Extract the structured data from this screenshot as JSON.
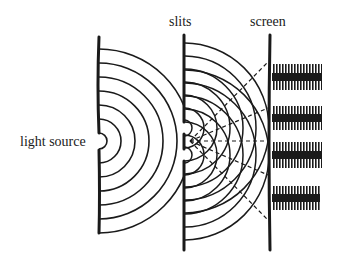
{
  "diagram": {
    "labels": {
      "source": "light source",
      "slits": "slits",
      "screen": "screen"
    },
    "colors": {
      "ink": "#1a1a1a",
      "background": "#ffffff"
    },
    "geometry": {
      "single_slit_barrier_x": 99,
      "single_slit_y": 141,
      "double_slit_barrier_x": 184,
      "double_slit_ys": [
        128,
        155
      ],
      "screen_x": 270,
      "source_wave_radii": [
        8,
        22,
        36,
        50,
        64,
        78,
        92
      ],
      "slit_wave_radii": [
        8,
        20,
        33,
        46,
        59,
        72,
        85
      ],
      "ray_targets_y": [
        62,
        108,
        141,
        175,
        220
      ],
      "fringe_bands": [
        [
          64,
          90
        ],
        [
          106,
          130
        ],
        [
          142,
          168
        ],
        [
          186,
          210
        ]
      ]
    }
  }
}
